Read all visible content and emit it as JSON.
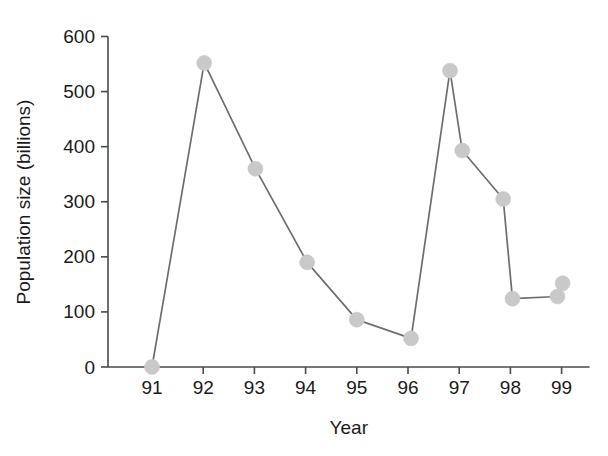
{
  "chart_data": {
    "type": "line",
    "title": "",
    "xlabel": "Year",
    "ylabel": "Population size (billions)",
    "xlim": [
      90.6,
      99.6
    ],
    "ylim": [
      0,
      600
    ],
    "grid": false,
    "legend": null,
    "x_tick_labels": [
      "91",
      "92",
      "93",
      "94",
      "95",
      "96",
      "97",
      "98",
      "99"
    ],
    "x_ticks": [
      91,
      92,
      93,
      94,
      95,
      96,
      97,
      98,
      99
    ],
    "y_tick_labels": [
      "0",
      "100",
      "200",
      "300",
      "400",
      "500",
      "600"
    ],
    "y_ticks": [
      0,
      100,
      200,
      300,
      400,
      500,
      600
    ],
    "marker": "circle",
    "marker_color": "#c9c9c9",
    "line_color": "#6e6e6e",
    "axis_color": "#4a4a4a",
    "background_color": "#ffffff",
    "x": [
      91.0,
      92.02,
      93.02,
      94.03,
      95.0,
      96.06,
      96.82,
      97.06,
      97.86,
      98.04,
      98.92,
      99.02
    ],
    "values": [
      0,
      552,
      360,
      190,
      86,
      52,
      538,
      393,
      305,
      124,
      128,
      152
    ],
    "points": [
      {
        "x": 91.0,
        "y": 0
      },
      {
        "x": 92.02,
        "y": 552
      },
      {
        "x": 93.02,
        "y": 360
      },
      {
        "x": 94.03,
        "y": 190
      },
      {
        "x": 95.0,
        "y": 86
      },
      {
        "x": 96.06,
        "y": 52
      },
      {
        "x": 96.82,
        "y": 538
      },
      {
        "x": 97.06,
        "y": 393
      },
      {
        "x": 97.86,
        "y": 305
      },
      {
        "x": 98.04,
        "y": 124
      },
      {
        "x": 98.92,
        "y": 128
      },
      {
        "x": 99.02,
        "y": 152
      }
    ]
  }
}
